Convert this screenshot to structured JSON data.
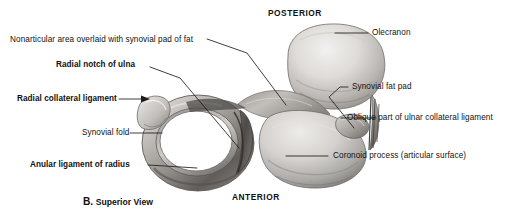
{
  "figure": {
    "caption_letter": "B.",
    "caption_text": "Superior View",
    "orientation": {
      "top": "POSTERIOR",
      "bottom": "ANTERIOR"
    },
    "labels": [
      {
        "id": "nonarticular-area",
        "text": "Nonarticular area overlaid with synovial pad of fat",
        "bold": false
      },
      {
        "id": "radial-notch-of-ulna",
        "text": "Radial notch of ulna",
        "bold": true
      },
      {
        "id": "radial-collateral-ligament",
        "text": "Radial collateral ligament",
        "bold": true
      },
      {
        "id": "synovial-fold",
        "text": "Synovial fold",
        "bold": false
      },
      {
        "id": "anular-ligament-of-radius",
        "text": "Anular ligament of radius",
        "bold": true
      },
      {
        "id": "olecranon",
        "text": "Olecranon",
        "bold": false
      },
      {
        "id": "synovial-fat-pad",
        "text": "Synovial fat pad",
        "bold": false
      },
      {
        "id": "oblique-part-ulnar-collateral-ligament",
        "text": "Oblique part of ulnar collateral ligament",
        "bold": false
      },
      {
        "id": "coronoid-process",
        "text": "Coronoid process (articular surface)",
        "bold": false
      }
    ]
  },
  "colors": {
    "background": "#ffffff",
    "text": "#111111",
    "leader_line": "#1c1c1c",
    "bone_light": "#e8e6e4",
    "bone_mid": "#c3c0bd",
    "bone_dark": "#8e8b88",
    "bone_shadow": "#5a5754",
    "cavity": "#ffffff"
  }
}
